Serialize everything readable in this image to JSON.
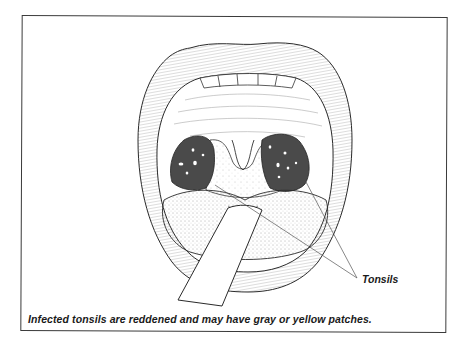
{
  "figure": {
    "labels": {
      "tonsils": "Tonsils"
    },
    "caption": "Infected tonsils are reddened and may have gray or yellow patches.",
    "colors": {
      "frame": "#3a3a3a",
      "ink": "#2a2a2a",
      "tonsil_fill": "#4a4a4a",
      "background": "#ffffff"
    }
  }
}
